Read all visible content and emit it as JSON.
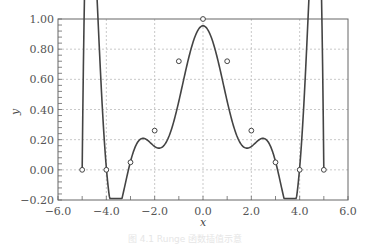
{
  "chart_data": {
    "type": "line",
    "title": "",
    "xlabel": "x",
    "ylabel": "y",
    "xlim": [
      -6.0,
      6.0
    ],
    "ylim": [
      -0.2,
      1.0
    ],
    "grid": true,
    "grid_style": "dashed",
    "legend": null,
    "x_ticks": [
      "−6.0",
      "−4.0",
      "−2.0",
      "0.0",
      "2.0",
      "4.0",
      "6.0"
    ],
    "y_ticks": [
      "−0.20",
      "0.00",
      "0.20",
      "0.40",
      "0.60",
      "0.80",
      "1.00"
    ],
    "series": [
      {
        "name": "interpolation nodes",
        "style": "open-circle markers",
        "x": [
          -5,
          -4,
          -3,
          -2,
          -1,
          0,
          1,
          2,
          3,
          4,
          5
        ],
        "y": [
          0.0385,
          0.0588,
          0.1,
          0.2,
          0.5,
          1.0,
          0.5,
          0.2,
          0.1,
          0.0588,
          0.0385
        ]
      },
      {
        "name": "interpolating polynomial",
        "style": "solid curve",
        "x": [
          -5.0,
          -4.8,
          -4.6,
          -4.4,
          -4.2,
          -4.0,
          -3.6,
          -3.0,
          -2.0,
          -1.0,
          0.0,
          1.0,
          2.0,
          3.0,
          3.6,
          4.0,
          4.2,
          4.4,
          4.6,
          4.8,
          5.0
        ],
        "y": [
          0.0,
          0.15,
          0.16,
          0.1,
          0.03,
          0.0,
          -0.02,
          0.05,
          0.26,
          0.72,
          1.0,
          0.72,
          0.26,
          0.05,
          -0.02,
          0.0,
          0.03,
          0.1,
          0.16,
          0.15,
          0.0
        ]
      }
    ],
    "marker_points_visual": {
      "x": [
        -5,
        -4,
        -3,
        -2,
        -1,
        0,
        1,
        2,
        3,
        4,
        5
      ],
      "y": [
        0.0,
        0.0,
        0.05,
        0.26,
        0.72,
        1.0,
        0.72,
        0.26,
        0.05,
        0.0,
        0.0
      ]
    }
  },
  "caption": "图 4.1  Runge 函数插值示意"
}
